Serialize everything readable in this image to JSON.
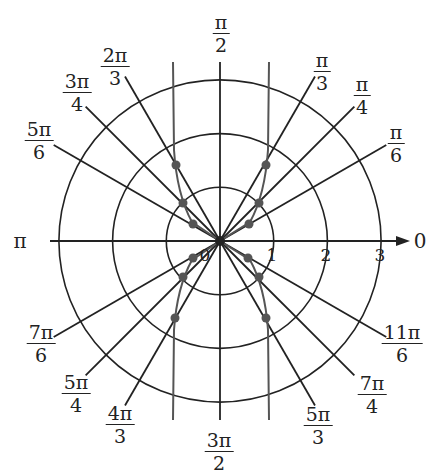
{
  "chart_data": {
    "type": "polar-graph",
    "center_px": [
      220,
      241
    ],
    "unit_px": 53.7,
    "circles": [
      1,
      2,
      3
    ],
    "radial_tick_labels": [
      "0",
      "1",
      "2",
      "3"
    ],
    "axis_labels": {
      "right": "0",
      "left": "π"
    },
    "angle_labels": [
      {
        "num": "π",
        "den": "2",
        "x": 221,
        "y": 12
      },
      {
        "num": "π",
        "den": "3",
        "x": 322,
        "y": 50
      },
      {
        "num": "π",
        "den": "4",
        "x": 362,
        "y": 74
      },
      {
        "num": "π",
        "den": "6",
        "x": 396,
        "y": 122
      },
      {
        "num": "2π",
        "den": "3",
        "x": 115,
        "y": 45
      },
      {
        "num": "3π",
        "den": "4",
        "x": 77,
        "y": 71
      },
      {
        "num": "5π",
        "den": "6",
        "x": 39,
        "y": 119
      },
      {
        "num": "7π",
        "den": "6",
        "x": 41,
        "y": 322
      },
      {
        "num": "5π",
        "den": "4",
        "x": 76,
        "y": 372
      },
      {
        "num": "4π",
        "den": "3",
        "x": 120,
        "y": 403
      },
      {
        "num": "3π",
        "den": "2",
        "x": 219,
        "y": 430
      },
      {
        "num": "5π",
        "den": "3",
        "x": 318,
        "y": 404
      },
      {
        "num": "7π",
        "den": "4",
        "x": 372,
        "y": 373
      },
      {
        "num": "11π",
        "den": "6",
        "x": 402,
        "y": 322
      }
    ],
    "rays_deg": [
      30,
      45,
      60,
      90,
      120,
      135,
      150,
      210,
      225,
      240,
      270,
      300,
      315,
      330
    ],
    "plotted_points_px": [
      [
        266,
        165
      ],
      [
        259,
        203
      ],
      [
        249,
        224
      ],
      [
        176,
        165
      ],
      [
        183,
        203
      ],
      [
        193,
        224
      ],
      [
        193,
        258
      ],
      [
        183,
        277
      ],
      [
        175,
        318
      ],
      [
        248,
        258
      ],
      [
        259,
        277
      ],
      [
        266,
        318
      ]
    ],
    "curve_asymptotes_px_x": [
      173,
      269
    ],
    "colors": {
      "line": "#222222",
      "curve": "#555555",
      "point": "#555555"
    }
  }
}
